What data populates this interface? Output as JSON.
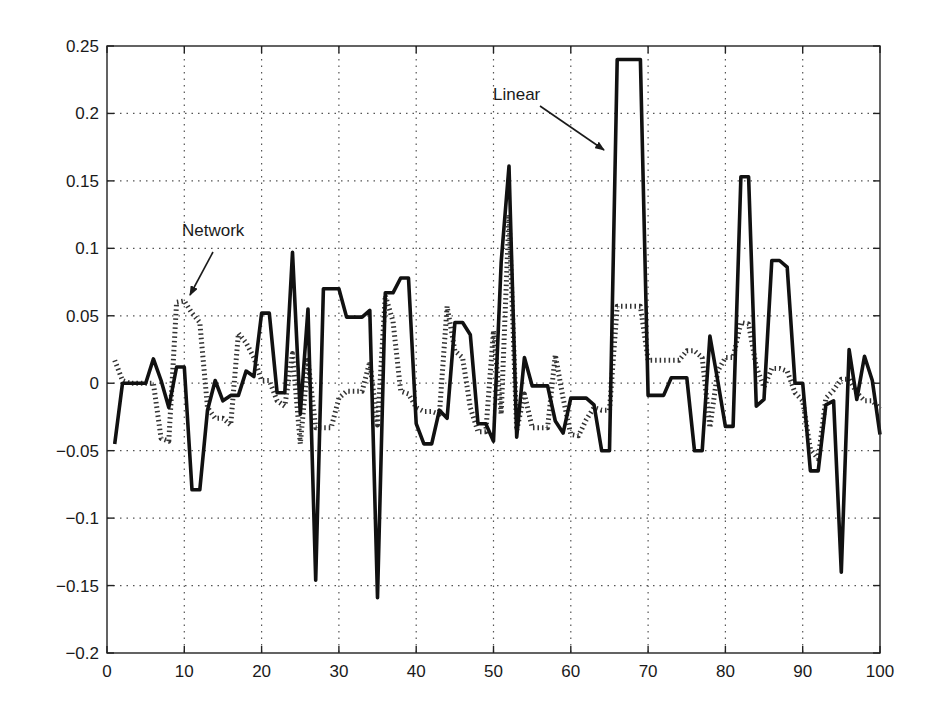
{
  "chart_data": {
    "type": "line",
    "title": "",
    "xlabel": "",
    "ylabel": "",
    "xlim": [
      0,
      100
    ],
    "ylim": [
      -0.2,
      0.25
    ],
    "grid": true,
    "legend": "none (inline annotations)",
    "x_ticks": [
      0,
      10,
      20,
      30,
      40,
      50,
      60,
      70,
      80,
      90,
      100
    ],
    "x_tick_labels": [
      "0",
      "10",
      "20",
      "30",
      "40",
      "50",
      "60",
      "70",
      "80",
      "90",
      "100"
    ],
    "y_ticks": [
      0.25,
      0.2,
      0.15,
      0.1,
      0.05,
      0,
      -0.05,
      -0.1,
      -0.15,
      -0.2
    ],
    "y_tick_labels": [
      "0.25",
      "0.2",
      "0.15",
      "0.1",
      "0.05",
      "0",
      "−0.05",
      "−0.1",
      "−0.15",
      "−0.2"
    ],
    "x": [
      1,
      2,
      3,
      4,
      5,
      6,
      7,
      8,
      9,
      10,
      11,
      12,
      13,
      14,
      15,
      16,
      17,
      18,
      19,
      20,
      21,
      22,
      23,
      24,
      25,
      26,
      27,
      28,
      29,
      30,
      31,
      32,
      33,
      34,
      35,
      36,
      37,
      38,
      39,
      40,
      41,
      42,
      43,
      44,
      45,
      46,
      47,
      48,
      49,
      50,
      51,
      52,
      53,
      54,
      55,
      56,
      57,
      58,
      59,
      60,
      61,
      62,
      63,
      64,
      65,
      66,
      67,
      68,
      69,
      70,
      71,
      72,
      73,
      74,
      75,
      76,
      77,
      78,
      79,
      80,
      81,
      82,
      83,
      84,
      85,
      86,
      87,
      88,
      89,
      90,
      91,
      92,
      93,
      94,
      95,
      96,
      97,
      98,
      99,
      100
    ],
    "series": [
      {
        "name": "Linear",
        "style": "solid-thick",
        "color": "#111111",
        "values": [
          -0.045,
          0,
          0,
          0,
          0,
          0.018,
          0.002,
          -0.018,
          0.012,
          0.012,
          -0.079,
          -0.079,
          -0.02,
          0.002,
          -0.013,
          -0.009,
          -0.009,
          0.009,
          0.005,
          0.052,
          0.052,
          -0.007,
          -0.007,
          0.097,
          -0.023,
          0.055,
          -0.146,
          0.07,
          0.07,
          0.07,
          0.049,
          0.049,
          0.049,
          0.054,
          -0.159,
          0.067,
          0.067,
          0.078,
          0.078,
          -0.03,
          -0.045,
          -0.045,
          -0.02,
          -0.026,
          0.045,
          0.045,
          0.036,
          -0.03,
          -0.03,
          -0.043,
          0.09,
          0.161,
          -0.04,
          0.019,
          -0.002,
          -0.002,
          -0.002,
          -0.028,
          -0.037,
          -0.011,
          -0.011,
          -0.011,
          -0.016,
          -0.05,
          -0.05,
          0.24,
          0.24,
          0.24,
          0.24,
          -0.009,
          -0.009,
          -0.009,
          0.004,
          0.004,
          0.004,
          -0.05,
          -0.05,
          0.035,
          0.002,
          -0.032,
          -0.032,
          0.153,
          0.153,
          -0.017,
          -0.012,
          0.091,
          0.091,
          0.086,
          0,
          0,
          -0.065,
          -0.065,
          -0.016,
          -0.013,
          -0.14,
          0.025,
          -0.012,
          0.02,
          0.002,
          -0.038
        ]
      },
      {
        "name": "Network",
        "style": "dotted",
        "color": "#333333",
        "values": [
          0.017,
          0.002,
          0,
          0,
          0,
          0,
          -0.041,
          -0.043,
          0.06,
          0.061,
          0.052,
          0.045,
          -0.018,
          -0.026,
          -0.026,
          -0.031,
          0.037,
          0.03,
          0.019,
          0.002,
          0.002,
          -0.013,
          -0.017,
          0.022,
          -0.045,
          0.017,
          -0.033,
          -0.033,
          -0.033,
          -0.011,
          -0.006,
          -0.006,
          -0.006,
          0.016,
          -0.031,
          0.065,
          0.046,
          -0.006,
          -0.008,
          -0.018,
          -0.021,
          -0.021,
          -0.023,
          0.057,
          0.024,
          0.019,
          -0.018,
          -0.036,
          -0.036,
          0.039,
          -0.023,
          0.125,
          -0.035,
          -0.008,
          -0.033,
          -0.033,
          -0.033,
          0.021,
          -0.011,
          -0.038,
          -0.039,
          -0.027,
          -0.018,
          -0.02,
          -0.02,
          0.057,
          0.057,
          0.057,
          0.057,
          0.017,
          0.017,
          0.017,
          0.017,
          0.017,
          0.024,
          0.024,
          0.019,
          -0.033,
          0.009,
          0.019,
          0.019,
          0.045,
          0.044,
          0.012,
          -0.003,
          0.011,
          0.011,
          0.009,
          -0.007,
          -0.013,
          -0.049,
          -0.056,
          -0.011,
          -0.005,
          0.003,
          0.003,
          -0.007,
          -0.013,
          -0.013,
          -0.019
        ]
      }
    ],
    "annotations": [
      {
        "text": "Linear",
        "text_pos": [
          493,
          100
        ],
        "arrow_from": [
          540,
          106
        ],
        "arrow_to": [
          604,
          150
        ]
      },
      {
        "text": "Network",
        "text_pos": [
          182,
          236
        ],
        "arrow_from": [
          213,
          252
        ],
        "arrow_to": [
          190,
          295
        ]
      }
    ]
  },
  "layout": {
    "plot_left": 107,
    "plot_right": 880,
    "plot_top": 46,
    "plot_bottom": 653,
    "grid_color": "#555555",
    "axis_color": "#222222"
  }
}
